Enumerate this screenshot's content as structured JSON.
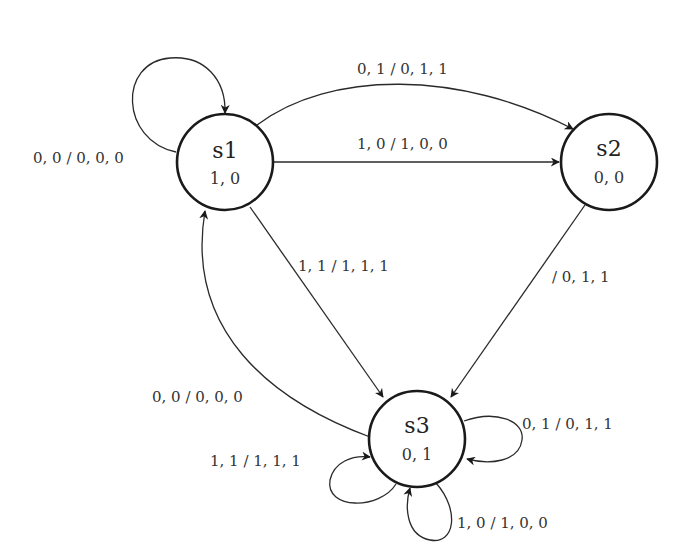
{
  "diagram": {
    "type": "finite-state-machine",
    "states": [
      {
        "id": "s1",
        "name": "s1",
        "output": "1, 0"
      },
      {
        "id": "s2",
        "name": "s2",
        "output": "0, 0"
      },
      {
        "id": "s3",
        "name": "s3",
        "output": "0, 1"
      }
    ],
    "transitions": [
      {
        "from": "s1",
        "to": "s1",
        "label": "0, 0 / 0, 0, 0"
      },
      {
        "from": "s1",
        "to": "s2",
        "label": "0, 1 / 0, 1, 1",
        "style": "curved"
      },
      {
        "from": "s1",
        "to": "s2",
        "label": "1, 0 / 1, 0, 0",
        "style": "straight"
      },
      {
        "from": "s1",
        "to": "s3",
        "label": "1, 1 / 1, 1, 1"
      },
      {
        "from": "s2",
        "to": "s3",
        "label": "/ 0, 1, 1"
      },
      {
        "from": "s3",
        "to": "s1",
        "label": "0, 0 / 0, 0, 0"
      },
      {
        "from": "s3",
        "to": "s3",
        "label": "0, 1 / 0, 1, 1",
        "position": "right"
      },
      {
        "from": "s3",
        "to": "s3",
        "label": "1, 1 / 1, 1, 1",
        "position": "left"
      },
      {
        "from": "s3",
        "to": "s3",
        "label": "1, 0 / 1, 0, 0",
        "position": "bottom"
      }
    ]
  }
}
